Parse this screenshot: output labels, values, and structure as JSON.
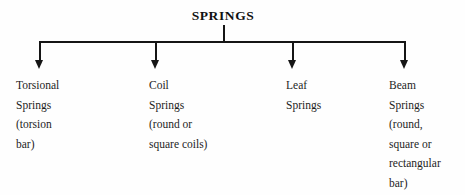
{
  "diagram": {
    "type": "tree",
    "orientation": "top-down",
    "background_color": "#fefefe",
    "line_color": "#151515",
    "text_color": "#1d1d1d",
    "root": {
      "label": "SPRINGS",
      "style": "bold-serif-uppercase"
    },
    "branches": [
      {
        "id": "torsional",
        "arrow": "down-arrow-icon",
        "lines": [
          "Torsional",
          "Springs",
          "(torsion",
          "bar)"
        ]
      },
      {
        "id": "coil",
        "arrow": "down-arrow-icon",
        "lines": [
          "Coil",
          "Springs",
          "(round or",
          "square coils)"
        ]
      },
      {
        "id": "leaf",
        "arrow": "down-arrow-icon",
        "lines": [
          "Leaf",
          "Springs"
        ]
      },
      {
        "id": "beam",
        "arrow": "down-arrow-icon",
        "lines": [
          "Beam",
          "Springs",
          "(round,",
          "square or",
          "rectangular",
          "bar)"
        ]
      }
    ]
  }
}
